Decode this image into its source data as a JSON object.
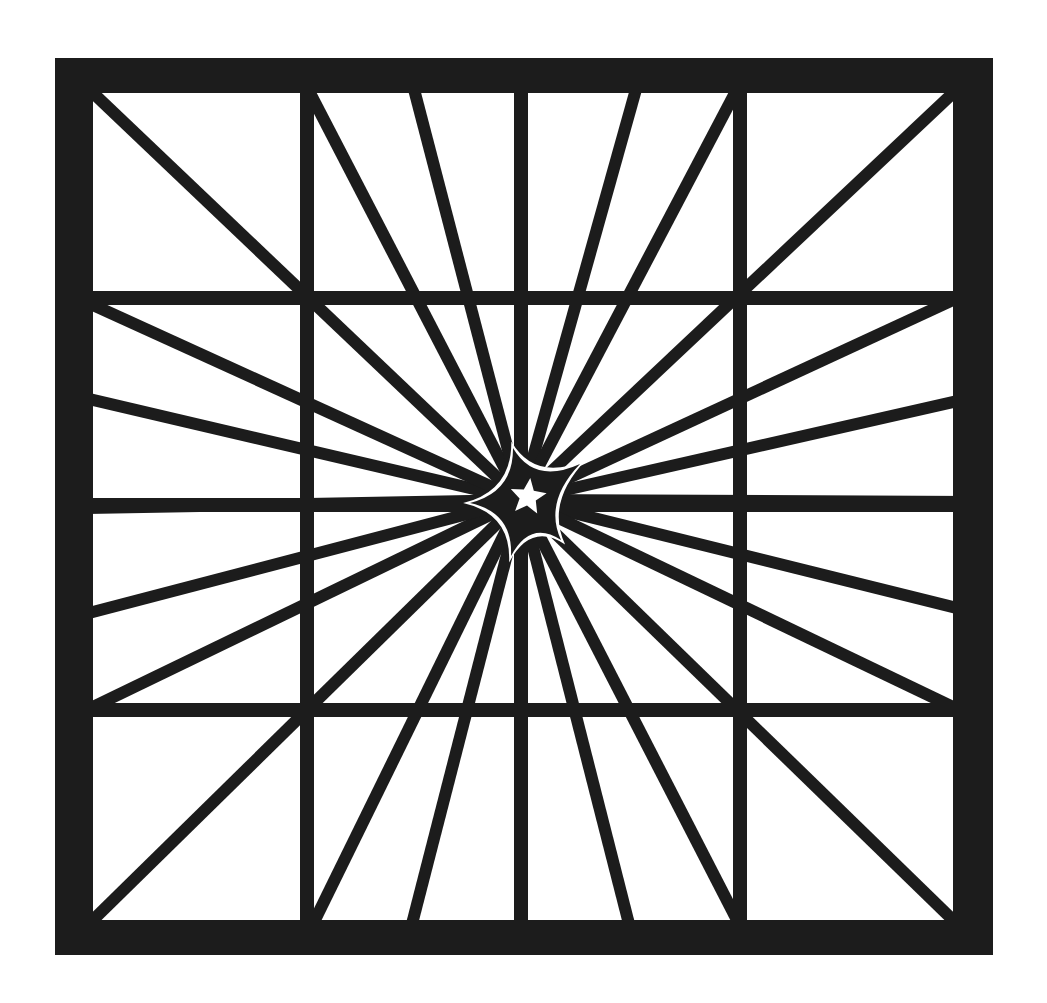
{
  "illustration": {
    "title": "",
    "description": "Square framed grid with radiating spokes converging on a central star",
    "colors": {
      "ink": "#1c1c1c",
      "paper": "#ffffff"
    },
    "frame": {
      "outer": [
        55,
        58,
        993,
        955
      ],
      "inner": [
        93,
        93,
        953,
        920
      ]
    },
    "grid": {
      "verticals": [
        307,
        521,
        740
      ],
      "horizontals": [
        298,
        505,
        710
      ],
      "stroke": 14
    },
    "center": [
      521,
      500
    ],
    "spokes": {
      "stroke": 12,
      "targets": [
        [
          93,
          93
        ],
        [
          310,
          93
        ],
        [
          415,
          93
        ],
        [
          520,
          93
        ],
        [
          635,
          93
        ],
        [
          735,
          93
        ],
        [
          953,
          93
        ],
        [
          953,
          300
        ],
        [
          953,
          402
        ],
        [
          953,
          502
        ],
        [
          953,
          607
        ],
        [
          953,
          707
        ],
        [
          953,
          920
        ],
        [
          737,
          920
        ],
        [
          628,
          920
        ],
        [
          522,
          920
        ],
        [
          413,
          920
        ],
        [
          315,
          920
        ],
        [
          93,
          920
        ],
        [
          93,
          707
        ],
        [
          93,
          612
        ],
        [
          93,
          508
        ],
        [
          93,
          400
        ],
        [
          93,
          305
        ]
      ]
    },
    "center_star": {
      "outer_points": [
        [
          513,
          448
        ],
        [
          580,
          464
        ],
        [
          561,
          540
        ],
        [
          511,
          556
        ],
        [
          470,
          503
        ]
      ],
      "inner_star_center": [
        528,
        497
      ],
      "inner_star_radius": 19
    }
  }
}
